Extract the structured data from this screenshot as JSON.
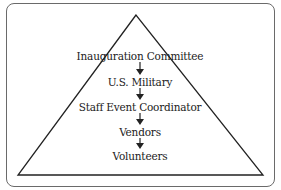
{
  "diagram": {
    "type": "hierarchy-pyramid",
    "shape": "triangle",
    "levels": [
      {
        "label": "Inauguration Committee"
      },
      {
        "label": "U.S. Military"
      },
      {
        "label": "Staff Event Coordinator"
      },
      {
        "label": "Vendors"
      },
      {
        "label": "Volunteers"
      }
    ],
    "connector": "down-arrow",
    "colors": {
      "frame_border": "#6a6a6a",
      "triangle_stroke": "#222222",
      "text": "#222222",
      "arrow": "#222222",
      "background": "#ffffff"
    }
  }
}
